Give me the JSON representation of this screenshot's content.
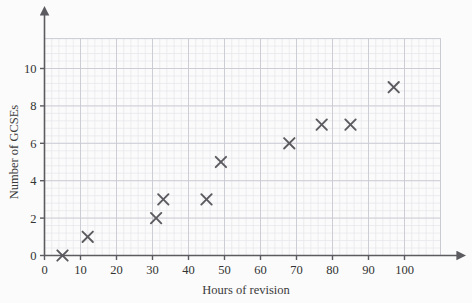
{
  "chart_data": {
    "type": "scatter",
    "title": "",
    "xlabel": "Hours of revision",
    "ylabel": "Number of GCSEs",
    "xlim": [
      0,
      110
    ],
    "ylim": [
      0,
      11.6
    ],
    "xticks": [
      0,
      10,
      20,
      30,
      40,
      50,
      60,
      70,
      80,
      90,
      100
    ],
    "yticks": [
      0,
      2,
      4,
      6,
      8,
      10
    ],
    "xtick_labels": [
      "0",
      "10",
      "20",
      "30",
      "40",
      "50",
      "60",
      "70",
      "80",
      "90",
      "100"
    ],
    "ytick_labels": [
      "0",
      "2",
      "4",
      "6",
      "8",
      "10"
    ],
    "grid": true,
    "grid_minor_step_x": 2,
    "grid_minor_step_y": 0.4,
    "grid_major_step_x": 10,
    "grid_major_step_y": 2,
    "legend": null,
    "marker": "x",
    "marker_color": "#5a5a5f",
    "points": [
      {
        "x": 5,
        "y": 0
      },
      {
        "x": 12,
        "y": 1
      },
      {
        "x": 31,
        "y": 2
      },
      {
        "x": 33,
        "y": 3
      },
      {
        "x": 45,
        "y": 3
      },
      {
        "x": 49,
        "y": 5
      },
      {
        "x": 68,
        "y": 6
      },
      {
        "x": 77,
        "y": 7
      },
      {
        "x": 85,
        "y": 7
      },
      {
        "x": 97,
        "y": 9
      }
    ]
  },
  "colors": {
    "background": "#fbfbfb",
    "axis": "#5b5b60",
    "grid_minor": "#e3e3ea",
    "grid_major": "#c9c9d2",
    "marker": "#5a5a5f",
    "text": "#333333"
  }
}
